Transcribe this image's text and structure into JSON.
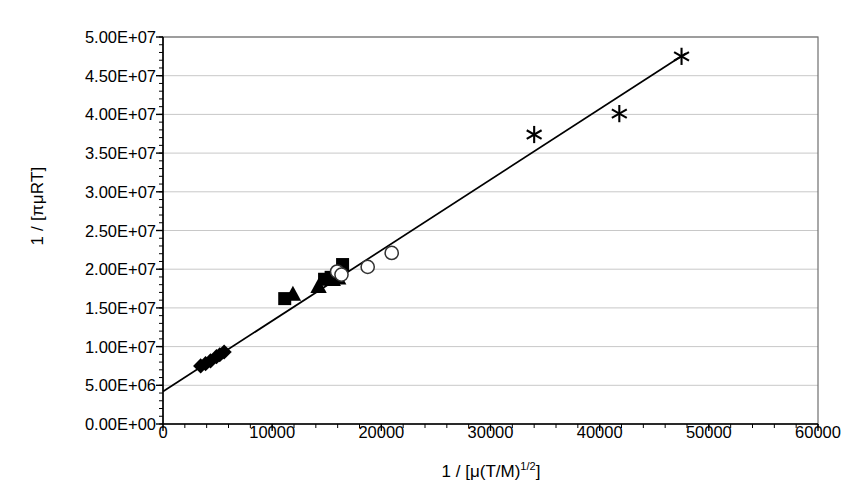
{
  "chart_data": {
    "type": "scatter",
    "title": "",
    "subtitle": "",
    "xlabel_plain": "1 / [mu(T/M)^1/2]",
    "ylabel_plain": "1 / [pi mu R T]",
    "xlim": [
      0,
      60000
    ],
    "ylim": [
      0,
      50000000
    ],
    "x_ticks": [
      0,
      10000,
      20000,
      30000,
      40000,
      50000,
      60000
    ],
    "x_tick_labels": [
      "0",
      "10000",
      "20000",
      "30000",
      "40000",
      "50000",
      "60000"
    ],
    "x_minor_tick_step": 2000,
    "y_ticks": [
      0,
      5000000,
      10000000,
      15000000,
      20000000,
      25000000,
      30000000,
      35000000,
      40000000,
      45000000,
      50000000
    ],
    "y_tick_labels": [
      "0.00E+00",
      "5.00E+06",
      "1.00E+07",
      "1.50E+07",
      "2.00E+07",
      "2.50E+07",
      "3.00E+07",
      "3.50E+07",
      "4.00E+07",
      "4.50E+07",
      "5.00E+07"
    ],
    "y_minor_tick_step": 1000000,
    "grid": {
      "horizontal": true,
      "vertical": false,
      "color": "#c8c8c8"
    },
    "legend": {
      "visible": false,
      "position": "none"
    },
    "plot_border": true,
    "series": [
      {
        "name": "series-diamonds",
        "marker": "filled-diamond",
        "color": "#000000",
        "points": [
          [
            3450,
            7500000
          ],
          [
            3900,
            7800000
          ],
          [
            4350,
            8150000
          ],
          [
            4900,
            8700000
          ],
          [
            5200,
            8950000
          ],
          [
            5600,
            9300000
          ]
        ]
      },
      {
        "name": "series-squares",
        "marker": "filled-square",
        "color": "#000000",
        "points": [
          [
            11150,
            16200000
          ],
          [
            14800,
            18700000
          ],
          [
            15400,
            18950000
          ],
          [
            16450,
            20600000
          ]
        ]
      },
      {
        "name": "series-triangles",
        "marker": "filled-triangle",
        "color": "#000000",
        "points": [
          [
            11900,
            16800000
          ],
          [
            14250,
            17800000
          ],
          [
            15550,
            18700000
          ],
          [
            16050,
            18900000
          ]
        ]
      },
      {
        "name": "series-open-circles",
        "marker": "open-circle",
        "color": "#000000",
        "points": [
          [
            15950,
            19700000
          ],
          [
            16350,
            19300000
          ],
          [
            18750,
            20300000
          ],
          [
            20950,
            22100000
          ]
        ]
      },
      {
        "name": "series-asterisks",
        "marker": "asterisk",
        "color": "#000000",
        "points": [
          [
            34000,
            37400000
          ],
          [
            41800,
            40100000
          ],
          [
            47500,
            47500000
          ]
        ]
      }
    ],
    "trendline": {
      "name": "linear-fit",
      "color": "#000000",
      "x_start": 0,
      "y_start": 4200000,
      "x_end": 47900,
      "y_end": 47900000,
      "slope": 912,
      "intercept": 4200000
    }
  },
  "axes": {
    "y_title_parts": {
      "prefix": "1 / [",
      "greek": "πμ",
      "suffix": "RT]"
    },
    "x_title_parts": {
      "prefix": "1 / [",
      "greek": "μ",
      "mid": "(T/M)",
      "exponent": "1/2",
      "suffix": "]"
    }
  }
}
